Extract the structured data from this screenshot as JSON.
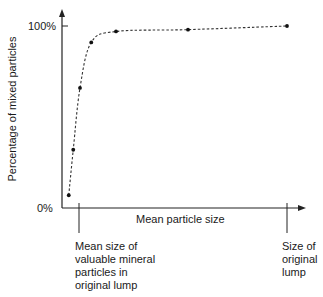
{
  "chart_data": {
    "type": "line",
    "title": "",
    "xlabel": "Mean particle size",
    "ylabel": "Percentage of mixed particles",
    "y_ticks": [
      "0%",
      "100%"
    ],
    "x_annotations": [
      "Mean size of valuable mineral particles in original lump",
      "Size of original lump"
    ],
    "series": [
      {
        "name": "Mixed particles",
        "style": "dashed with markers",
        "points": [
          {
            "x": 0.03,
            "y": 7
          },
          {
            "x": 0.05,
            "y": 32
          },
          {
            "x": 0.08,
            "y": 66
          },
          {
            "x": 0.13,
            "y": 91
          },
          {
            "x": 0.24,
            "y": 97
          },
          {
            "x": 0.56,
            "y": 98
          },
          {
            "x": 1.0,
            "y": 100
          }
        ]
      }
    ],
    "ylim": [
      0,
      100
    ],
    "xlim": [
      0,
      1.1
    ],
    "grid": false,
    "legend": null
  },
  "labels": {
    "y_top": "100%",
    "y_bottom": "0%",
    "x_axis": "Mean particle size",
    "y_axis": "Percentage of mixed particles",
    "left_mark_lines": [
      "Mean size of",
      "valuable mineral",
      "particles in",
      "original lump"
    ],
    "right_mark_lines": [
      "Size of",
      "original",
      "lump"
    ]
  }
}
